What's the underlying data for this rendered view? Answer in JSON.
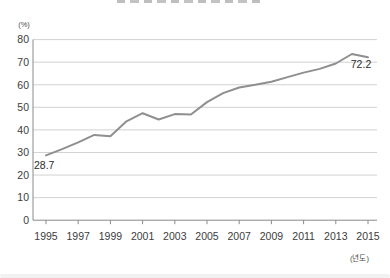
{
  "chart_data": {
    "type": "line",
    "title": "",
    "title_clipped": true,
    "y_unit_label": "(%)",
    "x_unit_label": "(년도)",
    "x_tick_labels": [
      "1995",
      "1997",
      "1999",
      "2001",
      "2003",
      "2005",
      "2007",
      "2009",
      "2011",
      "2013",
      "2015"
    ],
    "y_tick_labels": [
      "0",
      "10",
      "20",
      "30",
      "40",
      "50",
      "60",
      "70",
      "80"
    ],
    "xlim": [
      1995,
      2015
    ],
    "ylim": [
      0,
      80
    ],
    "grid": true,
    "legend": "none",
    "line_color": "#8f8f8f",
    "grid_color": "#d2d2d2",
    "axis_color": "#8a8a8a",
    "tick_label_color": "#3c3c3c",
    "unit_label_color": "#4a4a4a",
    "point_label_color": "#2b2b2b",
    "x": [
      1995,
      1996,
      1997,
      1998,
      1999,
      2000,
      2001,
      2002,
      2003,
      2004,
      2005,
      2006,
      2007,
      2008,
      2009,
      2010,
      2011,
      2012,
      2013,
      2014,
      2015
    ],
    "values": [
      28.7,
      31.5,
      34.5,
      37.8,
      37.2,
      43.8,
      47.4,
      44.6,
      47.0,
      46.8,
      52.3,
      56.3,
      58.8,
      60.0,
      61.3,
      63.4,
      65.4,
      67.0,
      69.4,
      73.6,
      72.2
    ],
    "point_labels": [
      {
        "x": 1995,
        "value": 28.7,
        "text": "28.7",
        "anchor": "start",
        "dx": -12,
        "dy": 14
      },
      {
        "x": 2015,
        "value": 72.2,
        "text": "72.2",
        "anchor": "middle",
        "dx": -7,
        "dy": 11
      }
    ]
  }
}
